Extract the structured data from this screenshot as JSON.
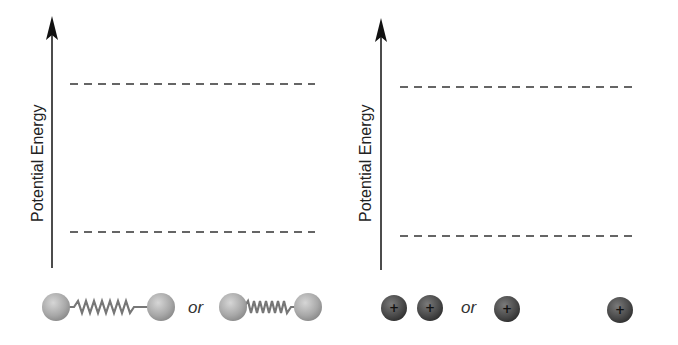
{
  "panels": [
    {
      "axis_label": "Potential Energy",
      "levels": [
        "upper-dashed-level",
        "lower-dashed-level"
      ],
      "bottom_items": {
        "left": "atoms-connected-by-stretched-spring",
        "separator": "or",
        "right": "atoms-connected-by-compressed-spring"
      }
    },
    {
      "axis_label": "Potential Energy",
      "levels": [
        "upper-dashed-level",
        "lower-dashed-level"
      ],
      "bottom_items": {
        "left": "two-positive-charges-close",
        "separator": "or",
        "right": "two-positive-charges-far-apart"
      }
    }
  ],
  "charge_symbol": "+",
  "colors": {
    "axis": "#111111",
    "dash": "#333333",
    "atom": "#a8a8a8",
    "spring": "#777777",
    "charge": "#4a4a4a"
  }
}
